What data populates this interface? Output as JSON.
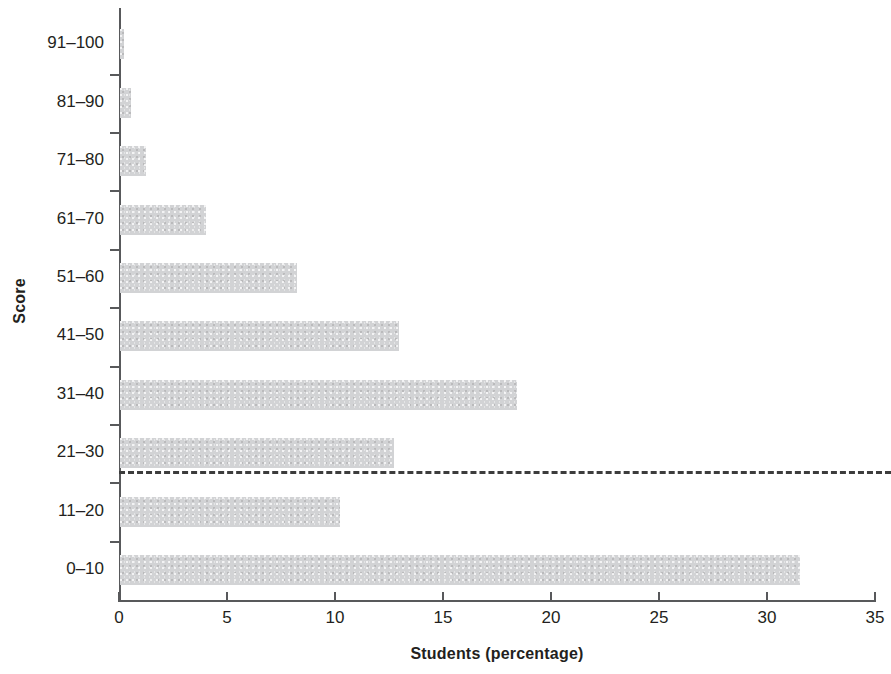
{
  "chart_data": {
    "type": "bar",
    "orientation": "horizontal",
    "title": "",
    "xlabel": "Students (percentage)",
    "ylabel": "Score",
    "categories": [
      "0–10",
      "11–20",
      "21–30",
      "31–40",
      "41–50",
      "51–60",
      "61–70",
      "71–80",
      "81–90",
      "91–100"
    ],
    "values": [
      31.5,
      10.2,
      12.7,
      18.4,
      12.9,
      8.2,
      4.0,
      1.2,
      0.5,
      0.2
    ],
    "xlim": [
      0,
      35
    ],
    "xticks": [
      0,
      5,
      10,
      15,
      20,
      25,
      30,
      35
    ],
    "xtick_labels": [
      "0",
      "5",
      "10",
      "15",
      "20",
      "25",
      "30",
      "35"
    ],
    "grid": false,
    "legend": null,
    "bar_color": "#d2d3d5",
    "axis_color": "#58595b",
    "text_color": "#231f20",
    "annotations": [
      {
        "name": "pass-threshold-line",
        "type": "horizontal-dashed-line",
        "between_categories": [
          "21–30",
          "11–20"
        ],
        "color": "#3c3c3c",
        "style": "dashed"
      }
    ]
  }
}
